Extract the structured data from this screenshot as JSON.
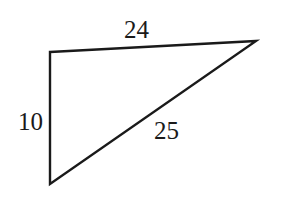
{
  "diagram": {
    "type": "triangle",
    "vertices": {
      "top_left": [
        50,
        52
      ],
      "top_right": [
        256,
        41
      ],
      "bottom_left": [
        50,
        184
      ]
    },
    "sides": [
      {
        "id": "top",
        "label": "24",
        "from": "top_left",
        "to": "top_right",
        "label_pos": [
          124,
          38
        ]
      },
      {
        "id": "left",
        "label": "10",
        "from": "top_left",
        "to": "bottom_left",
        "label_pos": [
          18,
          130
        ]
      },
      {
        "id": "hypotenuse",
        "label": "25",
        "from": "bottom_left",
        "to": "top_right",
        "label_pos": [
          154,
          139
        ]
      }
    ],
    "colors": {
      "stroke": "#1a1a1a",
      "background": "#ffffff"
    }
  }
}
